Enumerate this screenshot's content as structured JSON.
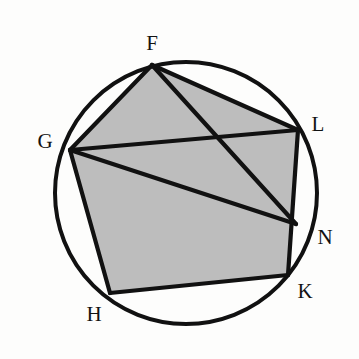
{
  "figure": {
    "background_color": "#fdfdfc",
    "stroke_color": "#111111",
    "fill_color": "#bdbdbd",
    "stroke_width": 4.2,
    "circle_stroke_width": 4.0
  },
  "circle": {
    "name": "circumscribed-circle",
    "cx": 186,
    "cy": 193,
    "r": 131
  },
  "points": [
    {
      "id": "F",
      "label": "F",
      "x": 152,
      "y": 65,
      "label_x": 152,
      "label_y": 43
    },
    {
      "id": "G",
      "label": "G",
      "x": 70,
      "y": 150,
      "label_x": 45,
      "label_y": 141
    },
    {
      "id": "L",
      "label": "L",
      "x": 298,
      "y": 130,
      "label_x": 318,
      "label_y": 124
    },
    {
      "id": "N",
      "label": "N",
      "x": 296,
      "y": 224,
      "label_x": 325,
      "label_y": 237
    },
    {
      "id": "K",
      "label": "K",
      "x": 288,
      "y": 275,
      "label_x": 305,
      "label_y": 291
    },
    {
      "id": "H",
      "label": "H",
      "x": 110,
      "y": 293,
      "label_x": 94,
      "label_y": 314
    }
  ],
  "shaded_polygon": {
    "name": "shaded-pentagon-FLKHG",
    "vertices": [
      "F",
      "L",
      "K",
      "H",
      "G"
    ],
    "points_attr": "152,65 298,130 288,275 110,293 70,150"
  },
  "segments": [
    {
      "name": "segment-FG",
      "from": "F",
      "to": "G",
      "x1": 152,
      "y1": 65,
      "x2": 70,
      "y2": 150
    },
    {
      "name": "segment-FL",
      "from": "F",
      "to": "L",
      "x1": 152,
      "y1": 65,
      "x2": 298,
      "y2": 130
    },
    {
      "name": "segment-FN",
      "from": "F",
      "to": "N",
      "x1": 152,
      "y1": 65,
      "x2": 296,
      "y2": 224
    },
    {
      "name": "segment-GL",
      "from": "G",
      "to": "L",
      "x1": 70,
      "y1": 150,
      "x2": 298,
      "y2": 130
    },
    {
      "name": "segment-GN",
      "from": "G",
      "to": "N",
      "x1": 70,
      "y1": 150,
      "x2": 296,
      "y2": 224
    },
    {
      "name": "segment-GH",
      "from": "G",
      "to": "H",
      "x1": 70,
      "y1": 150,
      "x2": 110,
      "y2": 293
    },
    {
      "name": "segment-LK",
      "from": "L",
      "to": "K",
      "x1": 298,
      "y1": 130,
      "x2": 288,
      "y2": 275
    },
    {
      "name": "segment-HK",
      "from": "H",
      "to": "K",
      "x1": 110,
      "y1": 293,
      "x2": 288,
      "y2": 275
    }
  ]
}
